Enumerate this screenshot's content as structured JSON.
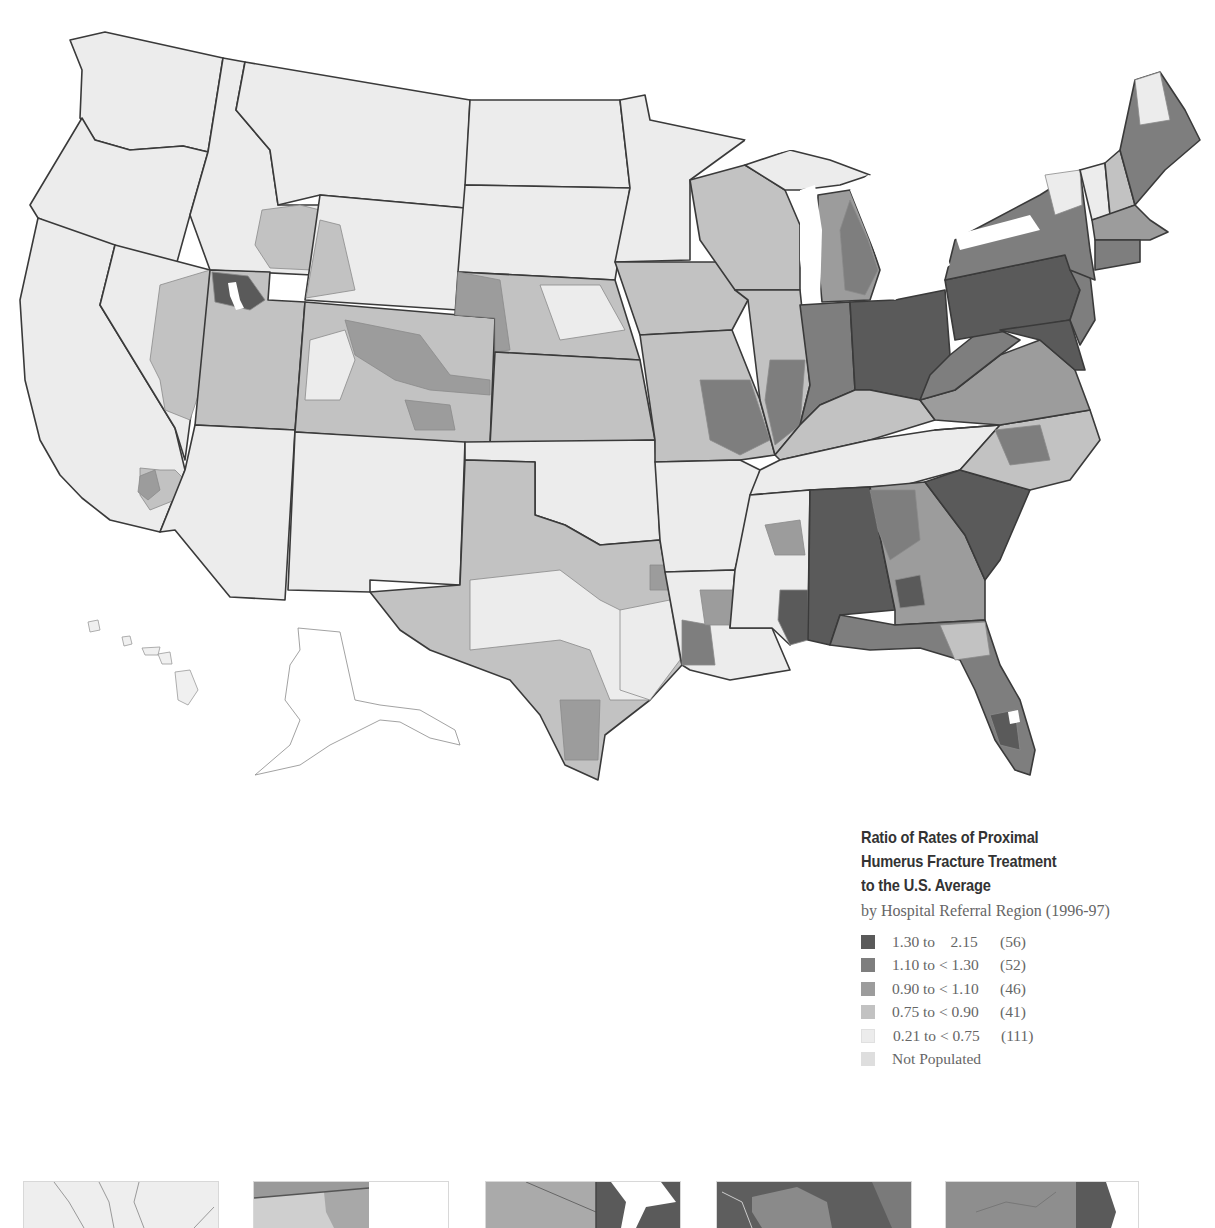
{
  "legend": {
    "title_lines": [
      "Ratio of Rates of Proximal",
      "Humerus Fracture Treatment",
      "to the U.S. Average"
    ],
    "subtitle": "by Hospital Referral Region (1996-97)",
    "classes": [
      {
        "range": "1.30 to    2.15",
        "count": "(56)",
        "color": "#5a5a5a"
      },
      {
        "range": "1.10 to < 1.30",
        "count": "(52)",
        "color": "#7e7e7e"
      },
      {
        "range": "0.90 to < 1.10",
        "count": "(46)",
        "color": "#9c9c9c"
      },
      {
        "range": "0.75 to < 0.90",
        "count": "(41)",
        "color": "#c2c2c2"
      },
      {
        "range": "0.21 to < 0.75",
        "count": "(111)",
        "color": "#ececec"
      },
      {
        "range": "Not Populated",
        "count": "",
        "color": "#dedede"
      }
    ]
  },
  "map": {
    "subject": "United States Hospital Referral Regions",
    "insets_shown": [
      "Alaska",
      "Hawaii"
    ],
    "regional_pattern": {
      "highest": [
        "Pennsylvania",
        "Maryland",
        "Delaware",
        "Ohio (west)",
        "Indiana (east)",
        "Alabama",
        "South Carolina",
        "Mississippi (southeast)",
        "Florida (parts)",
        "Utah (Salt Lake)"
      ],
      "lowest": [
        "Washington",
        "Oregon",
        "California",
        "Nevada",
        "Idaho",
        "Montana",
        "North Dakota",
        "South Dakota",
        "Arizona",
        "New Mexico",
        "Oklahoma",
        "Arkansas",
        "Vermont",
        "New Hampshire",
        "Alaska",
        "Hawaii"
      ]
    }
  },
  "bottom_insets": {
    "count": 5,
    "panels": [
      {
        "shade": "light"
      },
      {
        "shade": "mixed-light"
      },
      {
        "shade": "mixed-dark"
      },
      {
        "shade": "dark"
      },
      {
        "shade": "medium-dark"
      }
    ]
  }
}
